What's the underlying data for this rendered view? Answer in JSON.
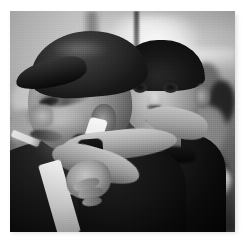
{
  "image": {
    "kind": "photograph",
    "medium": "black-and-white photographic print",
    "orientation": "square",
    "title": "Elderly man in a flat cap carrying a young boy on his back",
    "description": "A grainy black-and-white photograph of an elderly man seen in profile facing left, wearing a dark flat cap and with a cigarette in his mouth. A young boy rides on his back, arms wrapped around the man's shoulder, looking directly toward the camera. A crowd of people and bundles is blurred in the bright background.",
    "palette": {
      "page_background": "#ffffff",
      "print_border": "#ffffff",
      "shadow": "#d9d9d9",
      "highlight": "#f2f2f2",
      "midtone": "#8e8e8e",
      "shadow_tone": "#3a3a3a",
      "deep_black": "#0b0b0b"
    },
    "subjects": [
      {
        "name": "elderly-man",
        "position": "foreground left",
        "pose": "profile facing left",
        "attributes": [
          "dark flat cap",
          "cigarette in mouth",
          "dark jacket",
          "light strap over shoulder"
        ]
      },
      {
        "name": "young-boy",
        "position": "foreground right, carried on the man's back",
        "pose": "facing camera",
        "attributes": [
          "short dark hair",
          "dark high-collar jacket",
          "arms around man's shoulder",
          "wristwatch on arm"
        ]
      },
      {
        "name": "background-crowd",
        "position": "background",
        "pose": "blurred",
        "attributes": [
          "many people",
          "bundles and bags",
          "bright hall or station interior",
          "vertical pole"
        ]
      }
    ],
    "frame": {
      "photo_left": 10,
      "photo_top": 11,
      "photo_width": 225,
      "photo_height": 221,
      "mat_color": "#ffffff"
    }
  }
}
